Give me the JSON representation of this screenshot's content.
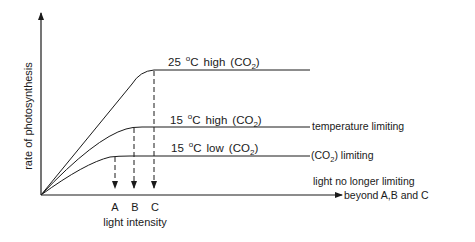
{
  "diagram": {
    "y_axis_label": "rate of photosynthesis",
    "x_axis_label": "light intensity",
    "points": [
      {
        "id": "A",
        "label": "A"
      },
      {
        "id": "B",
        "label": "B"
      },
      {
        "id": "C",
        "label": "C"
      }
    ],
    "curves": [
      {
        "temp": "25",
        "deg": "o",
        "unit": "C",
        "level": "high",
        "co2_open": "(CO",
        "co2_sub": "2",
        "co2_close": ")",
        "annotation": ""
      },
      {
        "temp": "15",
        "deg": "o",
        "unit": "C",
        "level": "high",
        "co2_open": "(CO",
        "co2_sub": "2",
        "co2_close": ")",
        "annotation": "temperature limiting"
      },
      {
        "temp": "15",
        "deg": "o",
        "unit": "C",
        "level": "low",
        "co2_open": "(CO",
        "co2_sub": "2",
        "co2_close": ")",
        "annotation_open": "(CO",
        "annotation_sub": "2",
        "annotation_close": ") limiting"
      }
    ],
    "light_note_line1": "light no longer limiting",
    "light_note_line2": "beyond A,B and C",
    "colors": {
      "ink": "#1a1a1a",
      "background": "#ffffff"
    }
  }
}
